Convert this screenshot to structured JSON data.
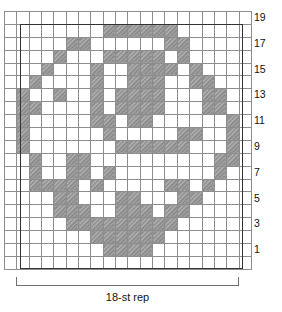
{
  "chart_data": {
    "type": "heatmap",
    "title": "",
    "xlabel": "18-st rep",
    "ylabel": "",
    "grid": true,
    "legend": "none",
    "columns": 20,
    "rows": 20,
    "cell_states": [
      "empty",
      "filled"
    ],
    "filled_color": "#8a8a8a",
    "empty_color": "#ffffff",
    "gridline_color": "#8d8d8d",
    "repeat_border_color": "#333333",
    "row_numbers": [
      19,
      17,
      15,
      13,
      11,
      9,
      7,
      5,
      3,
      1
    ],
    "repeat_columns": [
      1,
      18
    ],
    "matrix": [
      [
        0,
        0,
        0,
        0,
        0,
        0,
        0,
        0,
        0,
        0,
        0,
        0,
        0,
        0,
        0,
        0,
        0,
        0,
        0,
        0
      ],
      [
        0,
        0,
        0,
        0,
        0,
        0,
        0,
        0,
        1,
        1,
        1,
        1,
        1,
        1,
        0,
        0,
        0,
        0,
        0,
        0
      ],
      [
        0,
        0,
        0,
        0,
        0,
        1,
        1,
        0,
        0,
        0,
        0,
        0,
        0,
        1,
        1,
        0,
        0,
        0,
        0,
        0
      ],
      [
        0,
        0,
        0,
        0,
        1,
        0,
        0,
        0,
        1,
        1,
        1,
        1,
        1,
        0,
        1,
        0,
        0,
        0,
        0,
        0
      ],
      [
        0,
        0,
        0,
        1,
        0,
        0,
        0,
        1,
        0,
        0,
        1,
        1,
        1,
        1,
        0,
        1,
        0,
        0,
        0,
        0
      ],
      [
        0,
        0,
        1,
        0,
        0,
        0,
        0,
        1,
        0,
        0,
        1,
        1,
        1,
        0,
        0,
        1,
        1,
        0,
        0,
        0
      ],
      [
        0,
        1,
        0,
        0,
        1,
        0,
        0,
        1,
        0,
        1,
        1,
        1,
        1,
        0,
        0,
        0,
        1,
        1,
        0,
        0
      ],
      [
        0,
        1,
        1,
        0,
        0,
        0,
        0,
        1,
        0,
        1,
        1,
        1,
        1,
        0,
        0,
        0,
        1,
        1,
        0,
        0
      ],
      [
        0,
        1,
        0,
        0,
        0,
        0,
        0,
        1,
        1,
        0,
        1,
        1,
        0,
        0,
        0,
        0,
        0,
        0,
        1,
        0
      ],
      [
        0,
        1,
        0,
        0,
        0,
        0,
        0,
        0,
        1,
        0,
        0,
        0,
        0,
        0,
        1,
        1,
        0,
        0,
        1,
        0
      ],
      [
        0,
        1,
        0,
        0,
        0,
        0,
        0,
        0,
        0,
        1,
        1,
        1,
        1,
        1,
        1,
        0,
        0,
        0,
        1,
        0
      ],
      [
        0,
        0,
        1,
        0,
        0,
        1,
        1,
        0,
        0,
        0,
        0,
        0,
        0,
        0,
        0,
        0,
        0,
        1,
        1,
        0
      ],
      [
        0,
        0,
        1,
        0,
        0,
        1,
        1,
        0,
        1,
        0,
        0,
        0,
        0,
        0,
        0,
        0,
        0,
        1,
        0,
        0
      ],
      [
        0,
        0,
        1,
        1,
        1,
        1,
        0,
        1,
        0,
        0,
        0,
        0,
        0,
        1,
        1,
        0,
        1,
        0,
        0,
        0
      ],
      [
        0,
        0,
        0,
        0,
        1,
        1,
        0,
        0,
        0,
        1,
        1,
        0,
        0,
        0,
        1,
        1,
        0,
        0,
        0,
        0
      ],
      [
        0,
        0,
        0,
        0,
        1,
        1,
        1,
        0,
        0,
        1,
        1,
        1,
        0,
        1,
        1,
        0,
        0,
        0,
        0,
        0
      ],
      [
        0,
        0,
        0,
        0,
        0,
        1,
        1,
        1,
        1,
        1,
        1,
        1,
        1,
        1,
        0,
        0,
        0,
        0,
        0,
        0
      ],
      [
        0,
        0,
        0,
        0,
        0,
        0,
        0,
        1,
        1,
        1,
        1,
        1,
        1,
        0,
        0,
        0,
        0,
        0,
        0,
        0
      ],
      [
        0,
        0,
        0,
        0,
        0,
        0,
        0,
        0,
        1,
        1,
        1,
        1,
        0,
        0,
        0,
        0,
        0,
        0,
        0,
        0
      ],
      [
        0,
        0,
        0,
        0,
        0,
        0,
        0,
        0,
        0,
        0,
        0,
        0,
        0,
        0,
        0,
        0,
        0,
        0,
        0,
        0
      ]
    ]
  },
  "labels": {
    "repeat_caption": "18-st rep"
  }
}
